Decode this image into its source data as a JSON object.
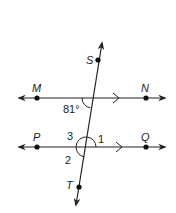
{
  "diagram": {
    "type": "parallel-lines-cut-by-transversal",
    "lines": [
      {
        "name": "MN",
        "points": [
          "M",
          "N"
        ],
        "parallel_mark": true
      },
      {
        "name": "PQ",
        "points": [
          "P",
          "Q"
        ],
        "parallel_mark": true
      },
      {
        "name": "ST",
        "points": [
          "S",
          "T"
        ],
        "role": "transversal"
      }
    ],
    "point_labels": {
      "S": "S",
      "T": "T",
      "M": "M",
      "N": "N",
      "P": "P",
      "Q": "Q"
    },
    "angles": {
      "given": "81°",
      "a1": "1",
      "a2": "2",
      "a3": "3"
    },
    "stroke_color": "#222222",
    "background": "#ffffff"
  }
}
